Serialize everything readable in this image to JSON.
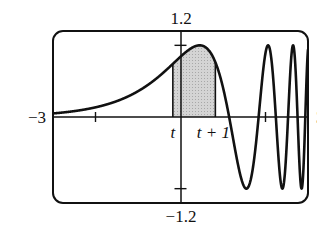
{
  "chart_data": {
    "type": "line",
    "title": "",
    "function": "sin(e^x)",
    "xlabel": "",
    "ylabel": "",
    "xlim": [
      -3,
      3
    ],
    "ylim": [
      -1.2,
      1.2
    ],
    "grid": false,
    "legend": null,
    "tick_labels": {
      "x_left": "−3",
      "x_right": "3",
      "y_top": "1.2",
      "y_bottom": "−1.2"
    },
    "x_ticks": [
      -2,
      2
    ],
    "y_ticks": [
      -1,
      1
    ],
    "annotations": [
      {
        "text": "t",
        "x": -0.18,
        "italic": true
      },
      {
        "text": "t + 1",
        "x": 0.82,
        "italic": true
      }
    ],
    "shaded_region": {
      "x_start": -0.18,
      "x_end": 0.82,
      "color": "#c8c8c8",
      "description": "area under curve from t to t+1"
    },
    "series": [
      {
        "name": "f(x)",
        "x": [
          -3,
          -2.5,
          -2,
          -1.5,
          -1,
          -0.5,
          -0.18,
          0,
          0.25,
          0.45,
          0.6,
          0.82,
          1.0,
          1.14,
          1.3,
          1.55,
          1.7,
          1.84,
          2.0,
          2.04,
          2.24,
          2.38,
          2.45,
          2.53,
          2.65,
          2.75,
          2.85,
          2.94,
          3.0
        ],
        "values": [
          0.05,
          0.08,
          0.13,
          0.22,
          0.36,
          0.56,
          0.73,
          0.84,
          0.97,
          1.0,
          0.98,
          0.81,
          0.41,
          0.0,
          -0.41,
          -1.0,
          -0.62,
          0.0,
          0.89,
          1.0,
          0.0,
          -0.98,
          -0.73,
          0.0,
          0.95,
          0.0,
          -0.99,
          0.0,
          0.47
        ]
      }
    ],
    "colors": {
      "curve": "#111111",
      "frame": "#111111",
      "shade": "#c8c8c8"
    }
  }
}
